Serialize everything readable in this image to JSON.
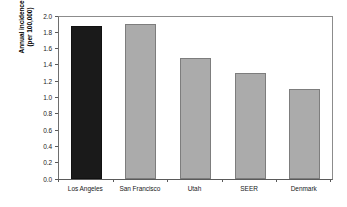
{
  "chart_data": {
    "type": "bar",
    "title": "",
    "xlabel": "",
    "ylabel": "Annual incidence (per 100,000)",
    "ylabel_line1": "Annual incidence",
    "ylabel_line2": "(per 100,000)",
    "categories": [
      "Los Angeles",
      "San Francisco",
      "Utah",
      "SEER",
      "Denmark"
    ],
    "values": [
      1.88,
      1.9,
      1.49,
      1.3,
      1.1
    ],
    "ylim": [
      0.0,
      2.0
    ],
    "ytick_labels": [
      "2.0",
      "1.8",
      "1.6",
      "1.4",
      "1.2",
      "1.0",
      "0.8",
      "0.6",
      "0.4",
      "0.2",
      "0.0"
    ],
    "ytick_values": [
      2.0,
      1.8,
      1.6,
      1.4,
      1.2,
      1.0,
      0.8,
      0.6,
      0.4,
      0.2,
      0.0
    ],
    "grid": false,
    "legend": false,
    "legend_position": "none",
    "bar_colors": [
      "#1a1a1a",
      "#ababab",
      "#ababab",
      "#ababab",
      "#ababab"
    ],
    "highlight_color": "#1a1a1a",
    "series_color": "#ababab",
    "axis_color": "#5a5a5a",
    "frame_color": "#8c8c8c",
    "background": "#ffffff"
  }
}
